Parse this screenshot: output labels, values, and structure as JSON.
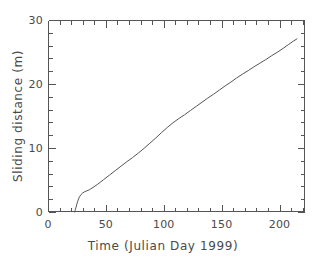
{
  "chart_data": {
    "type": "line",
    "title": "",
    "xlabel": "Time (Julian Day 1999)",
    "ylabel": "Sliding distance (m)",
    "xlim": [
      0,
      222
    ],
    "ylim": [
      0,
      30
    ],
    "xticks": [
      0,
      50,
      100,
      150,
      200
    ],
    "xtick_labels": [
      "0",
      "50",
      "100",
      "150",
      "200"
    ],
    "yticks": [
      0,
      10,
      20,
      30
    ],
    "ytick_labels": [
      "0",
      "10",
      "20",
      "30"
    ],
    "x_minor_tick_interval": 10,
    "y_minor_tick_interval": 2,
    "grid": false,
    "legend": null,
    "line_color": "#555555",
    "line_width": 1,
    "series": [
      {
        "name": "Sliding distance",
        "x": [
          23.0,
          23.6,
          24.2,
          24.9,
          25.6,
          26.4,
          27.3,
          28.4,
          29.8,
          31.5,
          33.5,
          36.0,
          39.0,
          43.0,
          48.0,
          53.0,
          58.0,
          63.0,
          68.0,
          73.0,
          78.0,
          83.0,
          88.0,
          93.0,
          98.0,
          103.0,
          108.0,
          113.0,
          118.0,
          123.0,
          128.0,
          133.0,
          138.0,
          143.0,
          148.0,
          153.0,
          158.0,
          163.0,
          168.0,
          173.0,
          178.0,
          183.0,
          188.0,
          193.0,
          198.0,
          203.0,
          208.0,
          212.0,
          215.0
        ],
        "y": [
          0.0,
          0.35,
          0.75,
          1.2,
          1.65,
          2.05,
          2.4,
          2.7,
          2.95,
          3.15,
          3.3,
          3.5,
          3.85,
          4.35,
          5.05,
          5.75,
          6.45,
          7.15,
          7.85,
          8.5,
          9.2,
          9.95,
          10.75,
          11.55,
          12.4,
          13.2,
          13.95,
          14.6,
          15.2,
          15.85,
          16.5,
          17.15,
          17.8,
          18.4,
          19.05,
          19.7,
          20.3,
          20.95,
          21.55,
          22.1,
          22.7,
          23.25,
          23.8,
          24.4,
          24.95,
          25.55,
          26.2,
          26.7,
          27.05
        ]
      }
    ]
  },
  "axes": {
    "x_title": "Time (Julian Day 1999)",
    "y_title": "Sliding distance (m)"
  }
}
